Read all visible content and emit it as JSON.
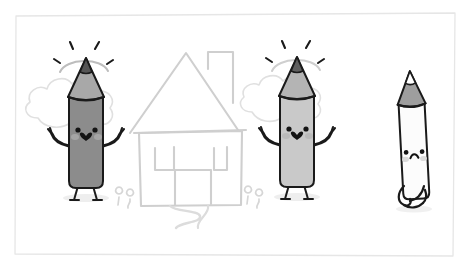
{
  "canvas": {
    "width": 469,
    "height": 270,
    "background_color": "#ffffff",
    "title": "Three pencil characters illustration"
  },
  "frame": {
    "name": "paper-border",
    "stroke_color": "#e3e3e3",
    "stroke_width": 1.2,
    "inset": {
      "x": 14,
      "y": 14,
      "width": 441,
      "height": 243
    }
  },
  "palette": {
    "ink": "#1a1a1a",
    "sketch_light": "#cfcfcf",
    "sketch_lighter": "#dcdcdc",
    "pencil_dark_body": "#8c8c8c",
    "pencil_dark_tip": "#a8a8a8",
    "pencil_mid_body": "#c9c9c9",
    "pencil_mid_tip": "#b4b4b4",
    "pencil_light_body": "#fbfbfb",
    "pencil_light_tip": "#9a9a9a",
    "shadow": "#ececec",
    "blush": "#d8d8d8"
  },
  "background_sketch": {
    "house": {
      "name": "house-sketch",
      "stroke_color": "#cfcfcf",
      "parts": [
        "roof",
        "chimney",
        "wall",
        "left-window",
        "right-window",
        "door",
        "path"
      ]
    },
    "clouds": [
      {
        "name": "cloud-left",
        "cx": 95,
        "cy": 105,
        "stroke_color": "#dcdcdc"
      },
      {
        "name": "cloud-right",
        "cx": 305,
        "cy": 100,
        "stroke_color": "#dcdcdc"
      }
    ],
    "flowers": [
      {
        "name": "flower-left-a",
        "x": 121,
        "y": 196
      },
      {
        "name": "flower-left-b",
        "x": 131,
        "y": 198
      },
      {
        "name": "flower-right-a",
        "x": 249,
        "y": 195
      },
      {
        "name": "flower-right-b",
        "x": 260,
        "y": 198
      }
    ]
  },
  "characters": [
    {
      "id": "pencil-happy-left",
      "label": "Happy pencil (dark)",
      "mood": "happy",
      "body_color": "#8c8c8c",
      "tip_color": "#a8a8a8",
      "x": 85,
      "y": 130,
      "has_arms": true,
      "has_legs": true,
      "has_sparkles": true,
      "face": {
        "eyes": "dots",
        "mouth": "heart",
        "blush": true
      }
    },
    {
      "id": "pencil-happy-right",
      "label": "Happy pencil (light gray)",
      "mood": "happy",
      "body_color": "#c9c9c9",
      "tip_color": "#b4b4b4",
      "x": 296,
      "y": 128,
      "has_arms": true,
      "has_legs": true,
      "has_sparkles": true,
      "face": {
        "eyes": "dots",
        "mouth": "heart",
        "blush": true
      }
    },
    {
      "id": "pencil-sad-right",
      "label": "Sad pencil (white)",
      "mood": "sad",
      "body_color": "#fbfbfb",
      "tip_color": "#9a9a9a",
      "x": 413,
      "y": 140,
      "has_arms": false,
      "has_legs": true,
      "has_sparkles": false,
      "face": {
        "eyes": "dots",
        "mouth": "frown",
        "blush": true
      }
    }
  ]
}
